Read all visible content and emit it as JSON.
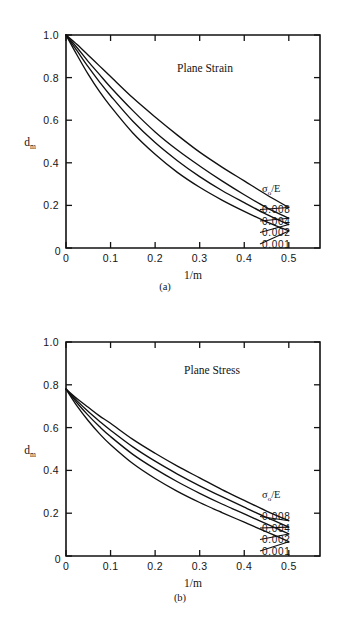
{
  "figure": {
    "panels": [
      {
        "caption": "(a)",
        "title": "Plane Strain",
        "legend_header": "σ₀/E"
      },
      {
        "caption": "(b)",
        "title": "Plane Stress",
        "legend_header": "σ₀/E"
      }
    ]
  },
  "axes": {
    "x_label": "1/m",
    "y_label": "d",
    "y_label_sub": "m",
    "x_ticks": [
      "0",
      "0.1",
      "0.2",
      "0.3",
      "0.4",
      "0.5"
    ],
    "y_ticks": [
      "0",
      "0.2",
      "0.4",
      "0.6",
      "0.8",
      "1.0"
    ],
    "legend_symbol_main": "σ",
    "legend_symbol_sub": "o",
    "legend_symbol_tail": "/E"
  },
  "chart_data": [
    {
      "type": "line",
      "title": "Plane Strain",
      "panel": "(a)",
      "xlabel": "1/m",
      "ylabel": "d_m",
      "xlim": [
        0,
        0.57
      ],
      "ylim": [
        0,
        1.0
      ],
      "xticks": [
        0,
        0.1,
        0.2,
        0.3,
        0.4,
        0.5
      ],
      "yticks": [
        0,
        0.2,
        0.4,
        0.6,
        0.8,
        1.0
      ],
      "grid": false,
      "legend_position": "inside-right",
      "legend_title": "σ₀/E",
      "x": [
        0,
        0.025,
        0.05,
        0.075,
        0.1,
        0.15,
        0.2,
        0.25,
        0.3,
        0.35,
        0.4,
        0.45,
        0.5
      ],
      "series": [
        {
          "name": "0.008",
          "values": [
            1.0,
            0.955,
            0.905,
            0.855,
            0.805,
            0.705,
            0.615,
            0.53,
            0.45,
            0.38,
            0.315,
            0.25,
            0.19
          ]
        },
        {
          "name": "0.004",
          "values": [
            1.0,
            0.94,
            0.875,
            0.815,
            0.755,
            0.645,
            0.545,
            0.46,
            0.385,
            0.315,
            0.25,
            0.19,
            0.14
          ]
        },
        {
          "name": "0.002",
          "values": [
            1.0,
            0.925,
            0.85,
            0.78,
            0.715,
            0.595,
            0.495,
            0.41,
            0.335,
            0.27,
            0.213,
            0.158,
            0.11
          ]
        },
        {
          "name": "0.001",
          "values": [
            1.0,
            0.905,
            0.815,
            0.735,
            0.665,
            0.54,
            0.44,
            0.355,
            0.285,
            0.225,
            0.172,
            0.123,
            0.08
          ]
        }
      ]
    },
    {
      "type": "line",
      "title": "Plane Stress",
      "panel": "(b)",
      "xlabel": "1/m",
      "ylabel": "d_m",
      "xlim": [
        0,
        0.57
      ],
      "ylim": [
        0,
        1.0
      ],
      "xticks": [
        0,
        0.1,
        0.2,
        0.3,
        0.4,
        0.5
      ],
      "yticks": [
        0,
        0.2,
        0.4,
        0.6,
        0.8,
        1.0
      ],
      "grid": false,
      "legend_position": "inside-right",
      "legend_title": "σ₀/E",
      "x": [
        0,
        0.025,
        0.05,
        0.075,
        0.1,
        0.15,
        0.2,
        0.25,
        0.3,
        0.35,
        0.4,
        0.45,
        0.5
      ],
      "series": [
        {
          "name": "0.008",
          "values": [
            0.78,
            0.735,
            0.695,
            0.655,
            0.62,
            0.545,
            0.48,
            0.42,
            0.365,
            0.31,
            0.26,
            0.21,
            0.165
          ]
        },
        {
          "name": "0.004",
          "values": [
            0.78,
            0.725,
            0.675,
            0.63,
            0.588,
            0.51,
            0.443,
            0.383,
            0.328,
            0.277,
            0.228,
            0.18,
            0.135
          ]
        },
        {
          "name": "0.002",
          "values": [
            0.78,
            0.715,
            0.657,
            0.605,
            0.558,
            0.475,
            0.407,
            0.347,
            0.293,
            0.243,
            0.197,
            0.15,
            0.103
          ]
        },
        {
          "name": "0.001",
          "values": [
            0.78,
            0.7,
            0.632,
            0.572,
            0.52,
            0.432,
            0.362,
            0.302,
            0.25,
            0.203,
            0.158,
            0.113,
            0.067
          ]
        }
      ]
    }
  ]
}
